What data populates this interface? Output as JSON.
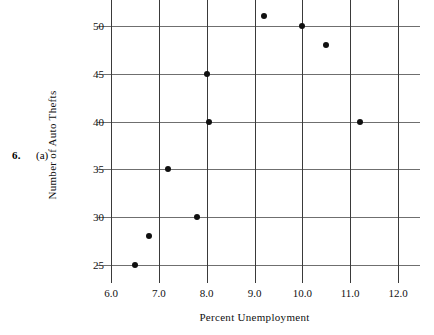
{
  "problem": {
    "number": "6.",
    "part": "(a)"
  },
  "chart_data": {
    "type": "scatter",
    "title": "",
    "xlabel": "Percent Unemployment",
    "ylabel": "Number of Auto Thefts",
    "xlim": [
      5.7,
      12.3
    ],
    "ylim": [
      23.5,
      51.8
    ],
    "xticks": [
      6.0,
      7.0,
      8.0,
      9.0,
      10.0,
      11.0,
      12.0
    ],
    "xtick_labels": [
      "6.0",
      "7.0",
      "8.0",
      "9.0",
      "10.0",
      "11.0",
      "12.0"
    ],
    "yticks": [
      25,
      30,
      35,
      40,
      45,
      50
    ],
    "ytick_labels": [
      "25",
      "30",
      "35",
      "40",
      "45",
      "50"
    ],
    "grid": true,
    "legend": false,
    "marker": "filled-circle",
    "marker_color": "#101010",
    "grid_color": "#6f6f6f",
    "axis_color": "#3a3a3a",
    "background": "#ffffff",
    "points": [
      {
        "x": 6.5,
        "y": 25
      },
      {
        "x": 6.8,
        "y": 28
      },
      {
        "x": 7.2,
        "y": 35
      },
      {
        "x": 7.8,
        "y": 30
      },
      {
        "x": 8.0,
        "y": 45
      },
      {
        "x": 8.05,
        "y": 40
      },
      {
        "x": 9.2,
        "y": 51
      },
      {
        "x": 10.0,
        "y": 50
      },
      {
        "x": 10.5,
        "y": 48
      },
      {
        "x": 11.2,
        "y": 40
      }
    ]
  }
}
